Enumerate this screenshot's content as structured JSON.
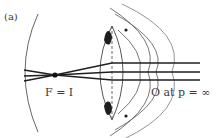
{
  "figure": {
    "panel_label": "(a)",
    "focal_label": "F = I",
    "object_label": "O at p = ∞"
  },
  "colors": {
    "ink": "#2b2b2b",
    "thin_ink": "#555555",
    "background": "#ffffff"
  },
  "elements": {
    "retina_arc": "curved image surface (retina)",
    "lens": "biconvex crystalline lens with dashed axis",
    "rays": "parallel rays converging to focal point",
    "ciliary_blobs": "dark ciliary muscle attachments",
    "outer_arcs": "cornea / ciliary body curves"
  }
}
